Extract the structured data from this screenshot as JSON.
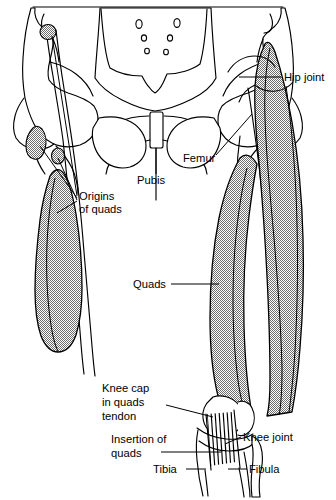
{
  "figure": {
    "background_color": "#ffffff",
    "ink_color": "#000000",
    "muscle_fill_description": "stippled mid-grey halftone",
    "muscle_fill_color": "#9a9a9a",
    "width": 336,
    "height": 500
  },
  "labels": [
    {
      "id": "hip-joint",
      "text": "Hip joint",
      "x": 284,
      "y": 81,
      "anchor": "start",
      "lines": 1
    },
    {
      "id": "femur",
      "text": "Femur",
      "x": 183,
      "y": 162,
      "anchor": "start",
      "lines": 1
    },
    {
      "id": "pubis",
      "text": "Pubis",
      "x": 137,
      "y": 184,
      "anchor": "start",
      "lines": 1
    },
    {
      "id": "origins-of-quads",
      "text_lines": [
        "Origins",
        "of quads"
      ],
      "x": 79,
      "y": 200,
      "anchor": "start",
      "lines": 2
    },
    {
      "id": "quads",
      "text": "Quads",
      "x": 133,
      "y": 285,
      "anchor": "start",
      "lines": 1
    },
    {
      "id": "knee-cap-in-quads-tendon",
      "text_lines": [
        "Knee cap",
        "in quads",
        "tendon"
      ],
      "x": 102,
      "y": 392,
      "anchor": "start",
      "lines": 3
    },
    {
      "id": "insertion-of-quads",
      "text_lines": [
        "Insertion of",
        "quads"
      ],
      "x": 111,
      "y": 443,
      "anchor": "start",
      "lines": 2
    },
    {
      "id": "knee-joint",
      "text": "Knee joint",
      "x": 243,
      "y": 440,
      "anchor": "start",
      "lines": 1
    },
    {
      "id": "tibia",
      "text": "Tibia",
      "x": 158,
      "y": 472,
      "anchor": "start",
      "lines": 1
    },
    {
      "id": "fibula",
      "text": "Fibula",
      "x": 249,
      "y": 472,
      "anchor": "start",
      "lines": 1
    }
  ],
  "anatomy_parts": [
    {
      "id": "sacrum",
      "name": "Sacrum",
      "side": "midline",
      "shaded": false
    },
    {
      "id": "ilium-left",
      "name": "Left ilium (hip bone)",
      "side": "viewer-left",
      "shaded": false
    },
    {
      "id": "ilium-right",
      "name": "Right ilium (hip bone)",
      "side": "viewer-right",
      "shaded": false
    },
    {
      "id": "pubic-symphysis",
      "name": "Pubic symphysis",
      "side": "midline",
      "shaded": false
    },
    {
      "id": "obturator-foramen-left",
      "name": "Left obturator foramen",
      "side": "viewer-left",
      "shaded": false
    },
    {
      "id": "obturator-foramen-right",
      "name": "Right obturator foramen",
      "side": "viewer-right",
      "shaded": false
    },
    {
      "id": "femur-left",
      "name": "Left femur",
      "side": "viewer-left",
      "shaded": false
    },
    {
      "id": "femur-right",
      "name": "Right femur",
      "side": "viewer-right",
      "shaded": false
    },
    {
      "id": "quads-left",
      "name": "Left quadriceps muscle mass",
      "side": "viewer-left",
      "shaded": true
    },
    {
      "id": "quads-right",
      "name": "Right quadriceps muscle mass",
      "side": "viewer-right",
      "shaded": true
    },
    {
      "id": "patella",
      "name": "Knee cap (patella)",
      "side": "viewer-right",
      "shaded": false
    },
    {
      "id": "patellar-tendon",
      "name": "Quads insertion tendon",
      "side": "viewer-right",
      "shaded": false
    },
    {
      "id": "tibia-bone",
      "name": "Tibia",
      "side": "viewer-right",
      "shaded": false
    },
    {
      "id": "fibula-bone",
      "name": "Fibula",
      "side": "viewer-right",
      "shaded": false
    },
    {
      "id": "origin-patch-asis",
      "name": "Origin patch at anterior superior iliac spine",
      "side": "viewer-left",
      "shaded": true
    },
    {
      "id": "origin-patch-aiis",
      "name": "Origin patch at anterior inferior iliac spine",
      "side": "viewer-left",
      "shaded": true
    },
    {
      "id": "origin-patch-acetabular",
      "name": "Origin patch above acetabular rim",
      "side": "viewer-left",
      "shaded": true
    },
    {
      "id": "origin-patch-right-femur",
      "name": "Origin patch on right femur shaft",
      "side": "viewer-right",
      "shaded": true
    }
  ],
  "sacral_foramina_count": 6
}
